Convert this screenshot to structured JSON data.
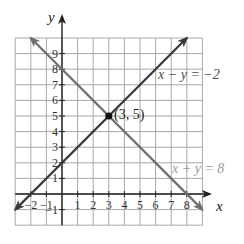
{
  "chart_data": {
    "type": "line",
    "title": "",
    "xlabel": "x",
    "ylabel": "y",
    "xlim": [
      -3,
      9
    ],
    "ylim": [
      -2,
      10
    ],
    "grid": true,
    "x_ticks": [
      -2,
      -1,
      1,
      2,
      3,
      4,
      5,
      6,
      7,
      8
    ],
    "y_ticks": [
      -1,
      1,
      2,
      3,
      4,
      5,
      6,
      7,
      8,
      9
    ],
    "series": [
      {
        "name": "x − y = −2",
        "equation": "y = x + 2",
        "color": "#3a3a3a",
        "label_color": "#4a4a4a",
        "points": [
          [
            -3,
            -1
          ],
          [
            8,
            10
          ]
        ],
        "arrows": "both"
      },
      {
        "name": "x + y = 8",
        "equation": "y = 8 - x",
        "color": "#6e6e6e",
        "label_color": "#9a9a9a",
        "points": [
          [
            -2,
            10
          ],
          [
            9,
            -1
          ]
        ],
        "arrows": "both"
      }
    ],
    "annotations": [
      {
        "type": "point",
        "x": 3,
        "y": 5,
        "label": "(3, 5)"
      }
    ]
  },
  "labels": {
    "x_axis": "x",
    "y_axis": "y",
    "line1": "x − y = −2",
    "line2": "x + y = 8",
    "intersection": "(3, 5)"
  }
}
